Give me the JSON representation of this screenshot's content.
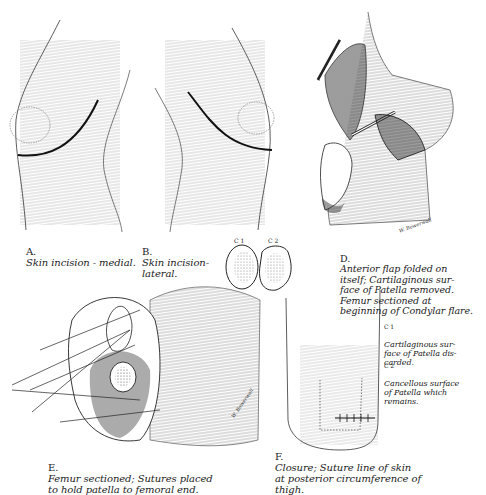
{
  "plate": {
    "panels": [
      {
        "id": "A",
        "label": "A.",
        "caption": "Skin incision - medial."
      },
      {
        "id": "B",
        "label": "B.",
        "caption": "Skin incision-\nlateral."
      },
      {
        "id": "C",
        "labels": [
          "C 1",
          "C 2"
        ]
      },
      {
        "id": "D",
        "label": "D.",
        "caption": "Anterior flap folded on\nitself; Cartilaginous sur-\nface of Patella removed.\nFemur sectioned at\nbeginning of Condylar flare."
      },
      {
        "id": "E",
        "label": "E.",
        "caption": "Femur sectioned; Sutures placed\nto hold patella to femoral end."
      },
      {
        "id": "F",
        "label": "F.",
        "caption": "Closure; Suture line of skin\nat posterior circumference of\nthigh."
      }
    ],
    "legend": [
      {
        "key": "C 1",
        "text": "Cartilaginous sur-\nface of Patella dis-\ncarded."
      },
      {
        "key": "C 2",
        "text": "Cancellous surface\nof Patella which\nremains."
      }
    ],
    "signatures": [
      "(?) W. Bowerwall",
      "W. Bowerwall",
      "W. Bowerwall"
    ]
  }
}
